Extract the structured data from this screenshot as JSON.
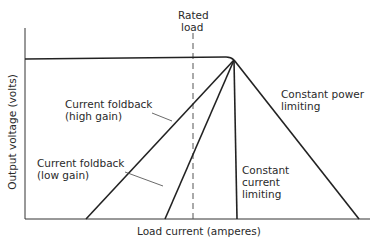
{
  "diagram": {
    "type": "power-supply-load-regulation-curves",
    "x_axis_label": "Load current (amperes)",
    "y_axis_label": "Output voltage (volts)",
    "rated_load_label_line1": "Rated",
    "rated_load_label_line2": "load",
    "curves": [
      {
        "name": "Current foldback (high gain)",
        "line1": "Current foldback",
        "line2": "(high gain)"
      },
      {
        "name": "Current foldback (low gain)",
        "line1": "Current foldback",
        "line2": "(low gain)"
      },
      {
        "name": "Constant current limiting",
        "line1": "Constant",
        "line2": "current",
        "line3": "limiting"
      },
      {
        "name": "Constant power limiting",
        "line1": "Constant power",
        "line2": "limiting"
      }
    ],
    "colors": {
      "line": "#222222",
      "background": "#ffffff"
    }
  }
}
